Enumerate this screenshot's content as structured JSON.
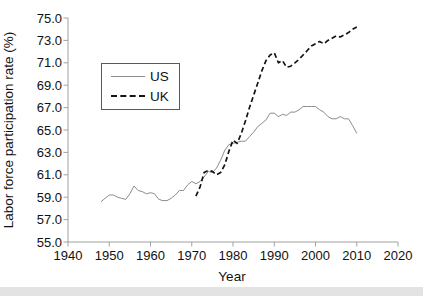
{
  "figure": {
    "background": "#ffffff",
    "window_edge_color": "#e3e3e3"
  },
  "chart_data": {
    "type": "line",
    "title": "",
    "xlabel": "Year",
    "ylabel": "Labor force participation rate (%)",
    "xlim": [
      1940,
      2020
    ],
    "ylim": [
      55.0,
      75.0
    ],
    "x_ticks": [
      1940,
      1950,
      1960,
      1970,
      1980,
      1990,
      2000,
      2010,
      2020
    ],
    "x_tick_labels": [
      "1940",
      "1950",
      "1960",
      "1970",
      "1980",
      "1990",
      "2000",
      "2010",
      "2020"
    ],
    "y_ticks": [
      55,
      57,
      59,
      61,
      63,
      65,
      67,
      69,
      71,
      73,
      75
    ],
    "y_tick_labels": [
      "55.0",
      "57.0",
      "59.0",
      "61.0",
      "63.0",
      "65.0",
      "67.0",
      "69.0",
      "71.0",
      "73.0",
      "75.0"
    ],
    "grid": false,
    "axis_color": "#a0a0a0",
    "text_color": "#111111",
    "legend": {
      "position": "upper-left-inside",
      "entries": [
        "US",
        "UK"
      ]
    },
    "series": [
      {
        "name": "US",
        "style": "solid",
        "color": "#8c8c8c",
        "width": 1,
        "start_year": 1948,
        "values": [
          58.6,
          58.9,
          59.2,
          59.2,
          59.0,
          58.9,
          58.8,
          59.3,
          60.0,
          59.6,
          59.5,
          59.3,
          59.4,
          59.3,
          58.8,
          58.7,
          58.7,
          58.9,
          59.2,
          59.6,
          59.6,
          60.1,
          60.4,
          60.2,
          60.4,
          60.8,
          61.3,
          61.2,
          61.6,
          62.3,
          63.2,
          63.7,
          63.8,
          63.9,
          64.0,
          64.0,
          64.4,
          64.8,
          65.3,
          65.6,
          65.9,
          66.5,
          66.5,
          66.2,
          66.4,
          66.3,
          66.6,
          66.6,
          66.8,
          67.1,
          67.1,
          67.1,
          67.1,
          66.8,
          66.6,
          66.2,
          66.0,
          66.0,
          66.2,
          66.0,
          66.0,
          65.4,
          64.7
        ]
      },
      {
        "name": "UK",
        "style": "dashed",
        "color": "#141414",
        "width": 1.7,
        "start_year": 1971,
        "values": [
          59.1,
          59.9,
          61.2,
          61.4,
          61.3,
          61.0,
          61.2,
          61.9,
          63.1,
          64.1,
          63.8,
          64.7,
          65.8,
          67.0,
          68.1,
          69.2,
          70.3,
          71.2,
          71.7,
          71.9,
          71.0,
          71.2,
          70.6,
          70.7,
          71.0,
          71.3,
          71.7,
          72.1,
          72.5,
          72.7,
          72.9,
          72.7,
          73.0,
          73.2,
          73.4,
          73.3,
          73.5,
          73.7,
          74.0,
          74.2
        ]
      }
    ]
  }
}
